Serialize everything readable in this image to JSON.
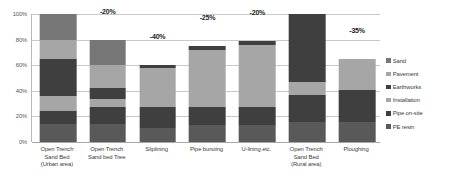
{
  "chart_data": {
    "type": "bar",
    "title": "",
    "subtitle": "",
    "xlabel": "",
    "ylabel": "",
    "stacked": true,
    "grid": true,
    "legend_position": "right",
    "ylim": [
      0,
      100
    ],
    "ytick_labels": [
      "100%",
      "80%",
      "60%",
      "40%",
      "20%",
      "0%"
    ],
    "ytick_values": [
      100,
      80,
      60,
      40,
      20,
      0
    ],
    "categories": [
      "Open Trench Sand Bed (Urban area)",
      "Open Trench Sand bed Tree",
      "Sliplining",
      "Pipe bursting",
      "U-lining etc.",
      "Open Trench Sand Bed (Rural area)",
      "Ploughing"
    ],
    "category_lines": [
      [
        "Open Trench",
        "Sand Bed",
        "(Urban area)"
      ],
      [
        "Open Trench",
        "Sand bed Tree"
      ],
      [
        "Sliplining"
      ],
      [
        "Pipe bursting"
      ],
      [
        "U-lining etc."
      ],
      [
        "Open Trench",
        "Sand Bed",
        "(Rural area)"
      ],
      [
        "Ploughing"
      ]
    ],
    "series": [
      {
        "name": "PE resin",
        "color": "#595959",
        "values": [
          14,
          14,
          11,
          13,
          13,
          16,
          16
        ]
      },
      {
        "name": "Pipe on-site",
        "color": "#3f3f3f",
        "values": [
          10,
          13,
          16,
          14,
          14,
          21,
          25
        ]
      },
      {
        "name": "Installation",
        "color": "#a6a6a6",
        "values": [
          12,
          7,
          31,
          45,
          49,
          10,
          24
        ]
      },
      {
        "name": "Earthworks",
        "color": "#3f3f3f",
        "values": [
          29,
          8,
          2,
          3,
          3,
          53,
          0
        ]
      },
      {
        "name": "Pavement",
        "color": "#a6a6a6",
        "values": [
          15,
          18,
          0,
          0,
          0,
          0,
          0
        ]
      },
      {
        "name": "Sand",
        "color": "#777777",
        "values": [
          20,
          20,
          0,
          0,
          0,
          0,
          0
        ]
      }
    ],
    "totals": [
      100,
      80,
      60,
      75,
      79,
      100,
      65
    ],
    "data_labels": [
      "",
      "-20%",
      "-40%",
      "-25%",
      "-20%",
      "",
      "-35%"
    ],
    "legend_entries": [
      {
        "label": "Sand",
        "color": "#777777"
      },
      {
        "label": "Pavement",
        "color": "#a6a6a6"
      },
      {
        "label": "Earthworks",
        "color": "#3f3f3f"
      },
      {
        "label": "Installation",
        "color": "#a6a6a6"
      },
      {
        "label": "Pipe on-site",
        "color": "#3f3f3f"
      },
      {
        "label": "PE resin",
        "color": "#595959"
      }
    ]
  }
}
